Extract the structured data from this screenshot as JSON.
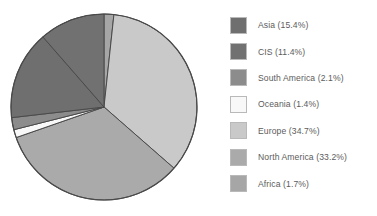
{
  "chart_data": {
    "type": "pie",
    "title": "",
    "subtitle": "",
    "xlabel": "",
    "ylabel": "",
    "grid": false,
    "legend_position": "right",
    "units": "percent",
    "start_angle_oclock": 12,
    "direction": "clockwise",
    "categories": [
      "Asia",
      "CIS",
      "South America",
      "Oceania",
      "Europe",
      "North America",
      "Africa"
    ],
    "values": [
      15.4,
      11.4,
      2.1,
      1.4,
      34.7,
      33.2,
      1.7
    ],
    "slice_order_clockwise_from_top": [
      "Africa",
      "Europe",
      "North America",
      "Oceania",
      "South America",
      "Asia",
      "CIS"
    ],
    "slices": [
      {
        "name": "Asia",
        "value": 15.4,
        "label": "Asia (15.4%)",
        "color": "#6f6f6f",
        "order": 6
      },
      {
        "name": "CIS",
        "value": 11.4,
        "label": "CIS (11.4%)",
        "color": "#717171",
        "order": 7
      },
      {
        "name": "South America",
        "value": 2.1,
        "label": "South America (2.1%)",
        "color": "#8c8c8c",
        "order": 5
      },
      {
        "name": "Oceania",
        "value": 1.4,
        "label": "Oceania (1.4%)",
        "color": "#f8f8f8",
        "order": 4
      },
      {
        "name": "Europe",
        "value": 34.7,
        "label": "Europe (34.7%)",
        "color": "#c9c9c9",
        "order": 2
      },
      {
        "name": "North America",
        "value": 33.2,
        "label": "North America (33.2%)",
        "color": "#aaaaaa",
        "order": 3
      },
      {
        "name": "Africa",
        "value": 1.7,
        "label": "Africa (1.7%)",
        "color": "#a6a6a6",
        "order": 1
      }
    ]
  },
  "legend": {
    "items": [
      {
        "label": "Asia (15.4%)",
        "color": "#6f6f6f"
      },
      {
        "label": "CIS (11.4%)",
        "color": "#717171"
      },
      {
        "label": "South America (2.1%)",
        "color": "#8c8c8c"
      },
      {
        "label": "Oceania (1.4%)",
        "color": "#f8f8f8"
      },
      {
        "label": "Europe (34.7%)",
        "color": "#c9c9c9"
      },
      {
        "label": "North America (33.2%)",
        "color": "#aaaaaa"
      },
      {
        "label": "Africa (1.7%)",
        "color": "#a6a6a6"
      }
    ]
  },
  "style": {
    "background": "#ffffff",
    "slice_outline": "#4a4a4a",
    "text_color": "#5c5c5c"
  },
  "geometry": {
    "center_x": 104,
    "center_y": 107,
    "radius": 93
  }
}
